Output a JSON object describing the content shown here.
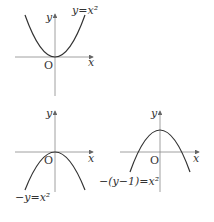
{
  "graphs": [
    {
      "id": "top-left",
      "equation": "y=x²",
      "x_label": "x",
      "y_label": "y",
      "origin_label": "O",
      "shape": "upward parabola, vertex at origin"
    },
    {
      "id": "bottom-left",
      "equation": "−y=x²",
      "x_label": "x",
      "y_label": "y",
      "origin_label": "O",
      "shape": "downward parabola, vertex at origin"
    },
    {
      "id": "bottom-right",
      "equation": "−(y−1)=x²",
      "x_label": "x",
      "y_label": "y",
      "origin_label": "O",
      "shape": "downward parabola, vertex at (0,1)"
    }
  ],
  "colors": {
    "curve": "#333333",
    "axis": "#888888"
  }
}
